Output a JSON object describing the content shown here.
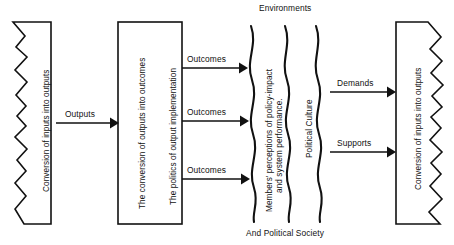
{
  "diagram": {
    "background_color": "#ffffff",
    "ink_color": "#111111",
    "boxes": [
      {
        "id": "left-box",
        "label": "Conversion of inputs into outputs",
        "edge_style": "zigzag-left"
      },
      {
        "id": "middle-box",
        "label_1": "The conversion of outputs into outcomes",
        "label_2": "The politics of output implementation",
        "edge_style": "plain"
      },
      {
        "id": "right-box",
        "label": "Conversion of inputs into outputs",
        "edge_style": "zigzag-right"
      }
    ],
    "environment": {
      "top_label": "Environments",
      "bottom_label": "And Political Society",
      "wave_labels": [
        {
          "line_1": "Members' perceptions of policy-impact",
          "line_2": "and system performance."
        },
        {
          "line_1": "Political Culture",
          "line_2": ""
        }
      ]
    },
    "arrows": [
      {
        "id": "outputs-arrow",
        "label": "Outputs"
      },
      {
        "id": "outcomes-arrow-1",
        "label": "Outcomes"
      },
      {
        "id": "outcomes-arrow-2",
        "label": "Outcomes"
      },
      {
        "id": "outcomes-arrow-3",
        "label": "Outcomes"
      },
      {
        "id": "demands-arrow",
        "label": "Demands"
      },
      {
        "id": "supports-arrow",
        "label": "Supports"
      }
    ]
  }
}
